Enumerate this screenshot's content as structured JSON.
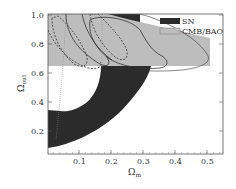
{
  "chart_data": {
    "type": "contour",
    "title": "",
    "xlabel": "Ω_m",
    "ylabel": "Ω_out",
    "xlim": [
      0.0,
      0.55
    ],
    "ylim": [
      0.03,
      1.0
    ],
    "xticks": [
      0.1,
      0.2,
      0.3,
      0.4,
      0.5
    ],
    "yticks": [
      0.2,
      0.4,
      0.6,
      0.8,
      1.0
    ],
    "xtick_labels": [
      "0.1",
      "0.2",
      "0.3",
      "0.4",
      "0.5"
    ],
    "ytick_labels": [
      "0.2",
      "0.4",
      "0.6",
      "0.8",
      "1.0"
    ],
    "grid": false,
    "legend": {
      "position": "upper right",
      "entries": [
        {
          "label": "SN",
          "color": "#2b2b2b"
        },
        {
          "label": "CMB/BAO",
          "color": "#bdbdbd"
        }
      ]
    },
    "regions": [
      {
        "name": "SN",
        "color": "#2b2b2b",
        "description": "Curved band from (0.0,0.05) bottom-left sweeping up to (0.28,0.64) with inner hole; also small patch near (0.2-0.28, 0.95-1.0)",
        "outer": [
          [
            0.0,
            0.05
          ],
          [
            0.05,
            0.08
          ],
          [
            0.12,
            0.14
          ],
          [
            0.2,
            0.25
          ],
          [
            0.26,
            0.38
          ],
          [
            0.3,
            0.5
          ],
          [
            0.32,
            0.6
          ],
          [
            0.32,
            0.64
          ],
          [
            0.17,
            0.64
          ]
        ],
        "inner": [
          [
            0.17,
            0.64
          ],
          [
            0.16,
            0.5
          ],
          [
            0.11,
            0.4
          ],
          [
            0.06,
            0.33
          ],
          [
            0.0,
            0.35
          ]
        ]
      },
      {
        "name": "CMB/BAO",
        "color": "#bdbdbd",
        "description": "Band across the top from Ω_out≈0.64 to 1.0, tapering to the right out to Ω_m≈0.5",
        "polygon": [
          [
            0.0,
            0.64
          ],
          [
            0.0,
            1.0
          ],
          [
            0.2,
            1.0
          ],
          [
            0.5,
            0.78
          ],
          [
            0.5,
            0.64
          ]
        ]
      }
    ],
    "contours": [
      {
        "style": "dashed",
        "color": "#333",
        "label": "inner dashed 1",
        "description": "elongated ellipse from (0.0,0.95) to (0.12,0.65)"
      },
      {
        "style": "dashed",
        "color": "#333",
        "label": "inner dashed 2",
        "description": "ellipse from (0.12,1.0) to (0.25,0.7)"
      },
      {
        "style": "solid",
        "color": "#333",
        "label": "solid 68%",
        "description": "curve from (0.06,1.0) to (0.22,0.66)"
      },
      {
        "style": "solid",
        "color": "#333",
        "label": "solid 95%",
        "description": "wiggly contour out to (0.44,0.7)"
      },
      {
        "style": "solid-thin",
        "color": "#333",
        "label": "outer ellipse",
        "description": "thin ellipse edge from (0.28,1.0) to (0.5,0.62)"
      },
      {
        "style": "dotted",
        "color": "#777",
        "label": "vertical dotted lines",
        "description": "near Ω_m≈0.06 and Ω_m≈0.17"
      }
    ]
  }
}
